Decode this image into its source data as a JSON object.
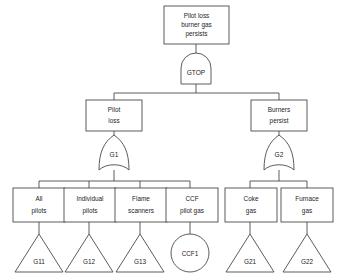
{
  "diagram": {
    "type": "fault-tree",
    "title_text": "",
    "colors": {
      "stroke": "#4a4a4a",
      "fill": "#ffffff",
      "text": "#1d1d1d",
      "background": "#ffffff"
    }
  },
  "top_event": {
    "label_line1": "Pilot loss",
    "label_line2": "burner gas",
    "label_line3": "persists",
    "shape": "rectangle"
  },
  "gates": {
    "top": {
      "id": "GTOP",
      "label": "GTOP",
      "type": "and-gate"
    },
    "left": {
      "id": "G1",
      "label": "G1",
      "type": "or-gate"
    },
    "right": {
      "id": "G2",
      "label": "G2",
      "type": "or-gate"
    }
  },
  "intermediate_events": [
    {
      "id": "pilot-loss",
      "label_line1": "Pilot",
      "label_line2": "loss",
      "shape": "rectangle"
    },
    {
      "id": "burners-persist",
      "label_line1": "Burners",
      "label_line2": "persist",
      "shape": "rectangle"
    }
  ],
  "leaf_events": [
    {
      "id": "all-pilots",
      "label_line1": "All",
      "label_line2": "pilots",
      "shape": "rectangle",
      "child": {
        "id": "G11",
        "label": "G11",
        "shape": "triangle"
      }
    },
    {
      "id": "individual-pilots",
      "label_line1": "Individual",
      "label_line2": "pilots",
      "shape": "rectangle",
      "child": {
        "id": "G12",
        "label": "G12",
        "shape": "triangle"
      }
    },
    {
      "id": "flame-scanners",
      "label_line1": "Flame",
      "label_line2": "scanners",
      "shape": "rectangle",
      "child": {
        "id": "G13",
        "label": "G13",
        "shape": "triangle"
      }
    },
    {
      "id": "ccf-pilot-gas",
      "label_line1": "CCF",
      "label_line2": "pilot gas",
      "shape": "rectangle",
      "child": {
        "id": "CCF1",
        "label": "CCF1",
        "shape": "circle"
      }
    },
    {
      "id": "coke-gas",
      "label_line1": "Coke",
      "label_line2": "gas",
      "shape": "rectangle",
      "child": {
        "id": "G21",
        "label": "G21",
        "shape": "triangle"
      }
    },
    {
      "id": "furnace-gas",
      "label_line1": "Furnace",
      "label_line2": "gas",
      "shape": "rectangle",
      "child": {
        "id": "G22",
        "label": "G22",
        "shape": "triangle"
      }
    }
  ]
}
